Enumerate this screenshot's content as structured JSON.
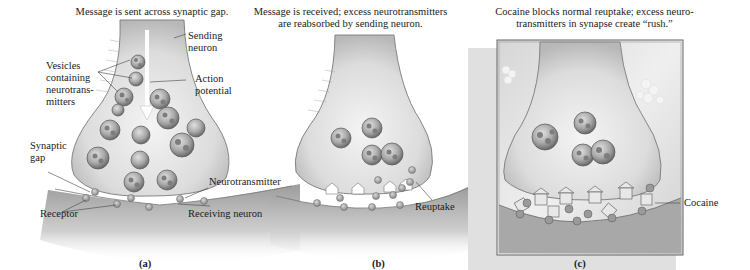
{
  "figure": {
    "panels": [
      {
        "id": "a",
        "letter": "(a)",
        "caption_lines": [
          "Message is sent across synaptic gap."
        ],
        "labels": {
          "sending_neuron": [
            "Sending",
            "neuron"
          ],
          "vesicles": [
            "Vesicles",
            "containing",
            "neurotrans-",
            "mitters"
          ],
          "action_potential": [
            "Action",
            "potential"
          ],
          "synaptic_gap": [
            "Synaptic",
            "gap"
          ],
          "neurotransmitter": "Neurotransmitter",
          "receptor": "Receptor",
          "receiving_neuron": "Receiving neuron"
        }
      },
      {
        "id": "b",
        "letter": "(b)",
        "caption_lines": [
          "Message is received; excess neurotransmitters",
          "are reabsorbed by sending neuron."
        ],
        "labels": {
          "reuptake": "Reuptake"
        }
      },
      {
        "id": "c",
        "letter": "(c)",
        "caption_lines": [
          "Cocaine blocks normal reuptake; excess neuro-",
          "transmitters in synapse create “rush.”"
        ],
        "labels": {
          "cocaine": "Cocaine"
        }
      }
    ],
    "colors": {
      "neuron_fill": "#e6e6e6",
      "neuron_edge": "#8a8a8a",
      "vesicle_fill": "#9a9a9a",
      "vesicle_edge": "#555555",
      "transmitter": "#a8a8a8",
      "receiving_shade": "#c4c4c4",
      "text": "#1a1a1a"
    }
  }
}
